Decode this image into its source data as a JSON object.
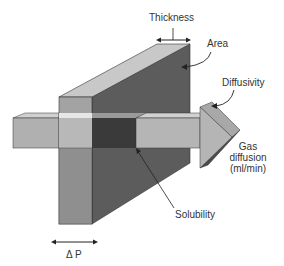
{
  "diagram": {
    "type": "membrane-gas-diffusion",
    "labels": {
      "thickness": "Thickness",
      "area": "Area",
      "diffusivity": "Diffusivity",
      "gas_diffusion_line1": "Gas",
      "gas_diffusion_line2": "diffusion",
      "gas_diffusion_line3": "(ml/min)",
      "solubility": "Solubility",
      "pressure_gradient": "Δ P"
    },
    "colors": {
      "slab_front": "#a3a3a3",
      "slab_top": "#c8c8c8",
      "slab_side": "#5c5c5c",
      "slab_side_lower": "#555555",
      "arrow_face": "#b5b5b5",
      "arrow_top": "#d0d0d0",
      "arrow_head_side": "#4a4a4a",
      "arrow_inside": "#3a3a3a",
      "highlight_band": "#e0e0e0",
      "outline": "#333333"
    }
  }
}
